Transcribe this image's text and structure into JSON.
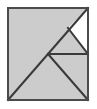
{
  "figure": {
    "title": "Dissected Square Tangram Figure",
    "type": "geometric-line-figure",
    "canvas": {
      "width": 97,
      "height": 109
    },
    "colors": {
      "background": "#ffffff",
      "fill_gray": "#cccccc",
      "fill_white": "#ffffff",
      "stroke_dark": "#3a3a3a",
      "stroke_border": "#4a4a4a"
    },
    "square": {
      "name": "outer-square",
      "top_left": [
        8,
        8
      ],
      "top_right": [
        88,
        8
      ],
      "bottom_right": [
        88,
        100
      ],
      "bottom_left": [
        8,
        100
      ],
      "fill": "#cccccc",
      "stroke": "#4a4a4a",
      "stroke_width": 2
    },
    "vertices": {
      "top_left": [
        8,
        8
      ],
      "top_right": [
        88,
        8
      ],
      "bottom_right": [
        88,
        100
      ],
      "bottom_left": [
        8,
        100
      ],
      "center": [
        48,
        54
      ],
      "right_mid": [
        88,
        54
      ],
      "upper_notch": [
        68,
        28
      ]
    },
    "segments": [
      {
        "name": "main-diagonal",
        "from": [
          8,
          100
        ],
        "to": [
          88,
          8
        ],
        "description": "long diagonal from bottom-left corner through center to top-right corner"
      },
      {
        "name": "center-to-bottom-right-diagonal",
        "from": [
          48,
          54
        ],
        "to": [
          88,
          100
        ],
        "description": "diagonal from center vertex to bottom-right corner"
      },
      {
        "name": "center-horizontal",
        "from": [
          48,
          54
        ],
        "to": [
          88,
          54
        ],
        "description": "horizontal line from center vertex to right edge midpoint"
      },
      {
        "name": "notch-diagonal",
        "from": [
          68,
          28
        ],
        "to": [
          88,
          54
        ],
        "description": "short diagonal closing the white triangle at upper right"
      }
    ],
    "regions": [
      {
        "name": "large-upper-left-triangle",
        "fill": "#cccccc",
        "points": [
          [
            8,
            8
          ],
          [
            88,
            8
          ],
          [
            8,
            100
          ]
        ]
      },
      {
        "name": "white-upper-right-triangle",
        "fill": "#ffffff",
        "points": [
          [
            88,
            8
          ],
          [
            68,
            28
          ],
          [
            88,
            54
          ]
        ]
      },
      {
        "name": "gray-mid-triangle",
        "fill": "#cccccc",
        "points": [
          [
            68,
            28
          ],
          [
            48,
            54
          ],
          [
            88,
            54
          ]
        ]
      },
      {
        "name": "gray-lower-right-triangle",
        "fill": "#cccccc",
        "points": [
          [
            48,
            54
          ],
          [
            88,
            54
          ],
          [
            88,
            100
          ]
        ]
      },
      {
        "name": "gray-lower-left-triangle",
        "fill": "#cccccc",
        "points": [
          [
            8,
            100
          ],
          [
            48,
            54
          ],
          [
            88,
            100
          ]
        ]
      }
    ]
  }
}
